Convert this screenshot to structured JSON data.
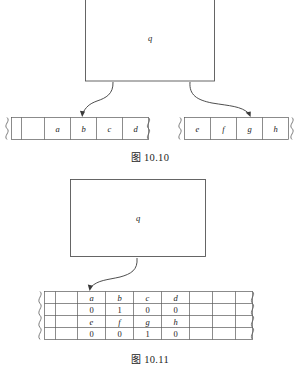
{
  "page": {
    "background_color": "#ffffff",
    "line_color": "#4a4a4a",
    "text_color": "#1a1a1a"
  },
  "figure_1": {
    "caption_cjk": "图",
    "caption_number": "10.10",
    "queue_box": {
      "label": "q"
    },
    "left_array": {
      "cells": [
        "",
        "a",
        "b",
        "c",
        "d"
      ],
      "has_left_break": true,
      "has_right_break": true
    },
    "right_array": {
      "cells": [
        "e",
        "f",
        "g",
        "h"
      ],
      "has_left_break": true,
      "has_right_break": true
    },
    "arrows": [
      {
        "name": "left-pointer-arrow",
        "from": "queue-box",
        "to": "left-array-cell-b"
      },
      {
        "name": "right-pointer-arrow",
        "from": "queue-box",
        "to": "right-array-cell-g"
      }
    ]
  },
  "figure_2": {
    "caption_cjk": "图",
    "caption_number": "10.11",
    "queue_box": {
      "label": "q"
    },
    "matrix": {
      "rows": [
        [
          "",
          "",
          "a",
          "b",
          "c",
          "d",
          "",
          "",
          ""
        ],
        [
          "",
          "",
          "0",
          "1",
          "0",
          "0",
          "",
          "",
          ""
        ],
        [
          "",
          "",
          "e",
          "f",
          "g",
          "h",
          "",
          "",
          ""
        ],
        [
          "",
          "",
          "0",
          "0",
          "1",
          "0",
          "",
          "",
          ""
        ]
      ],
      "row_styles": [
        "var",
        "num",
        "var",
        "num"
      ],
      "has_left_break": true,
      "has_right_break": true
    },
    "arrows": [
      {
        "name": "matrix-pointer-arrow",
        "from": "queue-box",
        "to": "matrix-cell-a"
      }
    ]
  }
}
